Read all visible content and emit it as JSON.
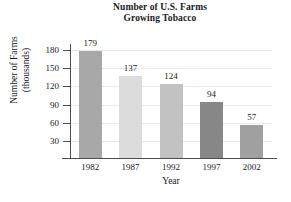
{
  "chart_data": {
    "type": "bar",
    "title": "Number of U.S. Farms Growing Tobacco",
    "title_lines": [
      "Number of U.S. Farms",
      "Growing Tobacco"
    ],
    "xlabel": "Year",
    "ylabel": "Number of Farms (thousands)",
    "ylabel_lines": [
      "Number of Farms",
      "(thousands)"
    ],
    "categories": [
      "1982",
      "1987",
      "1992",
      "1997",
      "2002"
    ],
    "values": [
      179,
      137,
      124,
      94,
      57
    ],
    "value_labels": [
      "179",
      "137",
      "124",
      "94",
      "57"
    ],
    "bar_colors": [
      "#a8a8a8",
      "#dcdcdc",
      "#c2c2c2",
      "#878787",
      "#a0a0a0"
    ],
    "ylim": [
      0,
      190
    ],
    "yticks": [
      30,
      60,
      90,
      120,
      150,
      180
    ],
    "ytick_labels": [
      "30",
      "60",
      "90",
      "120",
      "150",
      "180"
    ],
    "grid": true,
    "grid_color": "#e9e9e9",
    "legend": "none",
    "axis_color": "#4d4d4d",
    "background": "#ffffff"
  }
}
